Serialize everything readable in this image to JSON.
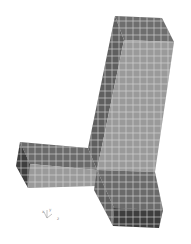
{
  "viewport": {
    "background": "#ffffff",
    "model": "t-junction-square-tube-mesh",
    "colors": {
      "face_light": "#9a9a9a",
      "face_mid": "#7c7c7c",
      "face_dark": "#5f5f5f",
      "face_darkest": "#3e3e3e",
      "mesh_line": "#d8d8d8"
    }
  },
  "triad": {
    "labels": {
      "x": "x",
      "y": "y",
      "z": "z"
    }
  }
}
